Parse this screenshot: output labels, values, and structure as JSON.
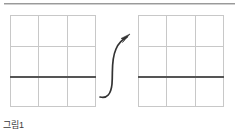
{
  "page": {
    "background_color": "#ffffff",
    "width": 239,
    "height": 130
  },
  "top_rule": {
    "name": "horizontal-divider",
    "color": "#9a9a9a"
  },
  "figures": {
    "left": {
      "label": "left-grid-figure",
      "columns": 3,
      "rows": 3,
      "grid_line_color": "#c8c8c8",
      "emphasis_line": {
        "name": "thick-horizontal-line",
        "color": "#555555",
        "position": "below-second-row"
      }
    },
    "right": {
      "label": "right-grid-figure",
      "columns": 3,
      "rows": 3,
      "grid_line_color": "#c8c8c8",
      "emphasis_line": {
        "name": "thick-horizontal-line",
        "color": "#555555",
        "position": "below-second-row"
      }
    }
  },
  "arrow": {
    "name": "curved-transition-arrow",
    "color": "#333333",
    "direction": "left-to-right-upward"
  },
  "caption": {
    "text": "그림1"
  },
  "colors": {
    "rule": "#9a9a9a",
    "grid": "#c8c8c8",
    "emphasis": "#555555",
    "arrow": "#333333"
  }
}
